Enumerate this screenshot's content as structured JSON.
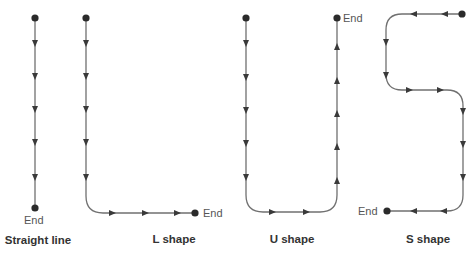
{
  "diagram": {
    "line_color": "#707070",
    "dot_color": "#2b2b2b",
    "shapes": [
      {
        "id": "straight",
        "caption": "Straight line",
        "end_label": "End"
      },
      {
        "id": "l",
        "caption": "L shape",
        "end_label": "End"
      },
      {
        "id": "u",
        "caption": "U shape",
        "end_label": "End"
      },
      {
        "id": "s",
        "caption": "S shape",
        "end_label": "End"
      }
    ]
  }
}
